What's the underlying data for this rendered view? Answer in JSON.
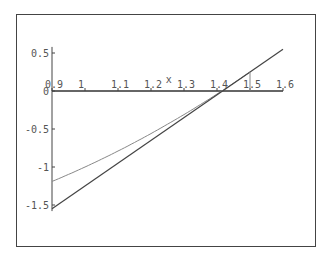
{
  "chart_data": {
    "type": "line",
    "title": "",
    "xlabel": "x",
    "ylabel": "",
    "xlim": [
      0.9,
      1.6
    ],
    "ylim": [
      -1.55,
      0.55
    ],
    "x_ticks": [
      "0.9",
      "1",
      "1.1",
      "1.2",
      "1.3",
      "1.4",
      "1.5",
      "1.6"
    ],
    "y_ticks": [
      "0.5",
      "0",
      "-0.5",
      "-1",
      "-1.5"
    ],
    "grid": false,
    "legend": null,
    "series": [
      {
        "name": "f(x) = x^2 - 2",
        "kind": "curve",
        "x": [
          0.9,
          1.0,
          1.1,
          1.2,
          1.3,
          1.4,
          1.5
        ],
        "y": [
          -1.19,
          -1.0,
          -0.79,
          -0.56,
          -0.31,
          -0.04,
          0.25
        ],
        "color": "#888888"
      },
      {
        "name": "tangent at x=1.5",
        "kind": "line",
        "x": [
          0.9,
          1.6
        ],
        "y": [
          -1.55,
          0.55
        ],
        "color": "#444444"
      },
      {
        "name": "vertical marker x=1.5",
        "kind": "segment",
        "x": [
          1.5,
          1.5
        ],
        "y": [
          0,
          0.25
        ],
        "color": "#888888"
      }
    ]
  },
  "axis": {
    "x_label": "x"
  }
}
